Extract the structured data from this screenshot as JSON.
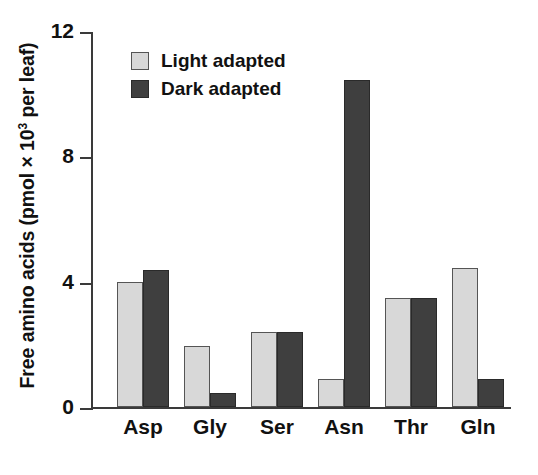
{
  "chart_data": {
    "type": "bar",
    "title": "",
    "xlabel": "",
    "ylabel": "Free amino acids (pmol × 10³ per leaf)",
    "ylabel_parts": {
      "pre": "Free amino acids (pmol × 10",
      "sup": "3",
      "post": " per leaf)"
    },
    "categories": [
      "Asp",
      "Gly",
      "Ser",
      "Asn",
      "Thr",
      "Gln"
    ],
    "series": [
      {
        "name": "Light adapted",
        "color": "#d8d8d8",
        "values": [
          4.0,
          1.95,
          2.4,
          0.9,
          3.5,
          4.45
        ]
      },
      {
        "name": "Dark adapted",
        "color": "#3f3f3f",
        "values": [
          4.4,
          0.45,
          2.4,
          10.5,
          3.5,
          0.9
        ]
      }
    ],
    "ylim": [
      0,
      12
    ],
    "yticks": [
      0,
      4,
      8,
      12
    ],
    "ytick_labels": [
      "0",
      "4",
      "8",
      "12"
    ],
    "grid": false,
    "legend_position": "upper-left-inside"
  },
  "legend": {
    "items": [
      {
        "label": "Light adapted",
        "swatch": "light"
      },
      {
        "label": "Dark adapted",
        "swatch": "dark"
      }
    ]
  },
  "colors": {
    "light_adapted": "#d8d8d8",
    "dark_adapted": "#3f3f3f",
    "axis": "#3a3a3a",
    "text": "#111111",
    "background": "#ffffff"
  }
}
